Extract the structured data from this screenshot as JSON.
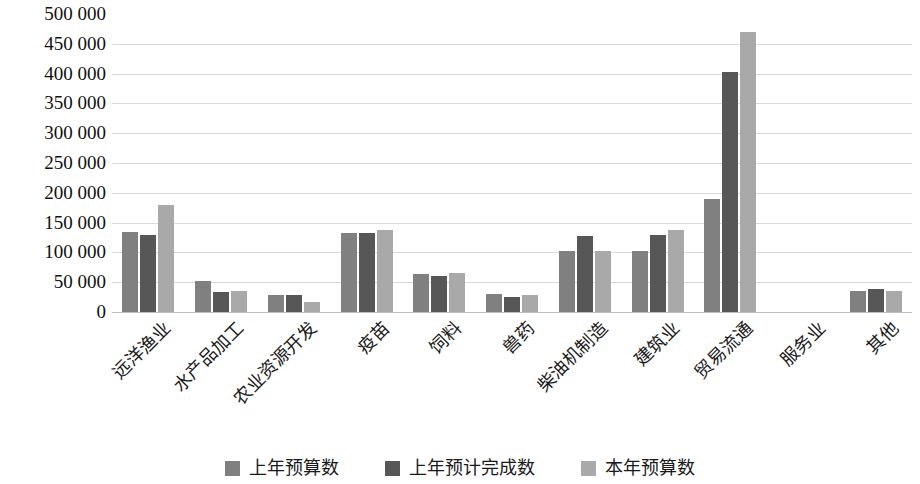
{
  "chart_data": {
    "type": "bar",
    "title": "",
    "subtitle": "",
    "xlabel": "",
    "ylabel": "",
    "ylim": [
      0,
      500000
    ],
    "ytick_step": 50000,
    "grid": true,
    "legend_position": "bottom",
    "orientation": "vertical",
    "group_mode": "grouped",
    "categories": [
      "远洋渔业",
      "水产品加工",
      "农业资源开发",
      "疫苗",
      "饲料",
      "兽药",
      "柴油机制造",
      "建筑业",
      "贸易流通",
      "服务业",
      "其他"
    ],
    "ytick_labels": [
      "500 000",
      "450 000",
      "400 000",
      "350 000",
      "300 000",
      "250 000",
      "200 000",
      "150 000",
      "100 000",
      "50 000",
      "0"
    ],
    "ytick_values": [
      500000,
      450000,
      400000,
      350000,
      300000,
      250000,
      200000,
      150000,
      100000,
      50000,
      0
    ],
    "series": [
      {
        "name": "上年预算数",
        "color": "#808080",
        "values": [
          135000,
          52000,
          28000,
          133000,
          63000,
          31000,
          102000,
          103000,
          190000,
          0,
          35000
        ]
      },
      {
        "name": "上年预计完成数",
        "color": "#575757",
        "values": [
          130000,
          33000,
          28000,
          133000,
          60000,
          26000,
          128000,
          130000,
          402000,
          0,
          38000
        ]
      },
      {
        "name": "本年预算数",
        "color": "#a9a9a9",
        "values": [
          180000,
          35000,
          17000,
          137000,
          65000,
          29000,
          103000,
          138000,
          470000,
          0,
          35000
        ]
      }
    ]
  },
  "legend": {
    "items": [
      {
        "label": "上年预算数",
        "color": "#808080"
      },
      {
        "label": "上年预计完成数",
        "color": "#575757"
      },
      {
        "label": "本年预算数",
        "color": "#a9a9a9"
      }
    ]
  },
  "style": {
    "gridline_color": "#d9d9d9",
    "axis_color": "#bfbfbf",
    "text_color": "#1a1a1a",
    "background": "#ffffff"
  }
}
